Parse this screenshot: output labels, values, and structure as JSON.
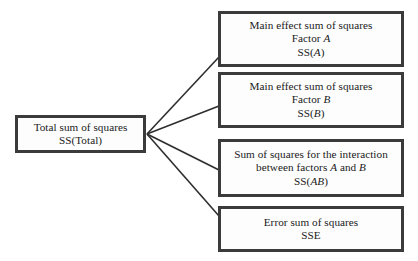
{
  "diagram": {
    "type": "tree-partition",
    "background_color": "#ffffff",
    "border_color": "#3b3b3b",
    "text_color": "#1a1a1a",
    "connector_color": "#2e2e2e",
    "source": {
      "id": "total",
      "label_lines": [
        "Total sum of squares",
        "SS(Total)"
      ],
      "line1": "Total sum of squares",
      "line2": "SS(Total)"
    },
    "targets": [
      {
        "id": "factor-a",
        "line1": "Main effect sum of squares",
        "line2_prefix": "Factor ",
        "line2_var": "A",
        "line3_prefix": "SS(",
        "line3_var": "A",
        "line3_suffix": ")"
      },
      {
        "id": "factor-b",
        "line1": "Main effect sum of squares",
        "line2_prefix": "Factor ",
        "line2_var": "B",
        "line3_prefix": "SS(",
        "line3_var": "B",
        "line3_suffix": ")"
      },
      {
        "id": "interaction-ab",
        "line1": "Sum of squares for the interaction",
        "line2_prefix": "between factors ",
        "line2_var": "A",
        "line2_mid": " and ",
        "line2_var2": "B",
        "line3_prefix": "SS(",
        "line3_var": "AB",
        "line3_suffix": ")"
      },
      {
        "id": "error",
        "line1": "Error sum of squares",
        "line2": "SSE"
      }
    ]
  }
}
